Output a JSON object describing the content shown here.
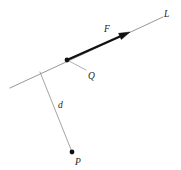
{
  "figure": {
    "type": "geometry-diagram",
    "background_color": "#ffffff",
    "width": 181,
    "height": 170
  },
  "colors": {
    "line_of_action": "#8a8a8a",
    "moment_arm": "#9a9a9a",
    "leader": "#9a9a9a",
    "force_vector": "#111111",
    "point_marker": "#111111",
    "label_text": "#1a1a1a"
  },
  "labels": {
    "line_L": "L",
    "force_F": "F",
    "point_Q": "Q",
    "distance_d": "d",
    "point_P": "P"
  },
  "geometry": {
    "line_of_action": {
      "name": "line-L",
      "x1": 10,
      "y1": 88,
      "x2": 163,
      "y2": 17
    },
    "force_vector": {
      "name": "force-F",
      "x1": 67,
      "y1": 60,
      "x2": 130,
      "y2": 32,
      "stroke_width": 2.2,
      "arrow_head": "filled-triangle"
    },
    "moment_arm": {
      "name": "distance-d",
      "x1": 40,
      "y1": 72,
      "x2": 72,
      "y2": 152
    },
    "leader_line_Q": {
      "name": "leader-to-Q",
      "x1": 69,
      "y1": 61,
      "x2": 86,
      "y2": 70
    },
    "point_Q": {
      "cx": 67,
      "cy": 60,
      "r": 2.4
    },
    "point_P": {
      "cx": 72,
      "cy": 152,
      "r": 2.4
    }
  },
  "label_positions": {
    "line_L": {
      "x": 164,
      "y": 17
    },
    "force_F": {
      "x": 104,
      "y": 32
    },
    "point_Q": {
      "x": 88,
      "y": 79
    },
    "distance_d": {
      "x": 58,
      "y": 108
    },
    "point_P": {
      "x": 75,
      "y": 165
    }
  }
}
